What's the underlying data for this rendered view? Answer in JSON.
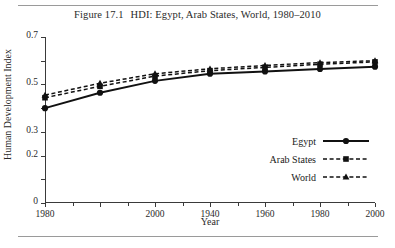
{
  "figure": {
    "caption_number": "Figure 17.1",
    "caption_text": "HDI: Egypt, Arab States, World, 1980–2010"
  },
  "chart_data": {
    "type": "line",
    "title": "HDI: Egypt, Arab States, World, 1980–2010",
    "xlabel": "Year",
    "ylabel": "Human Development Index",
    "xlim": [
      1980,
      2010
    ],
    "ylim": [
      0,
      0.7
    ],
    "grid": false,
    "legend_position": "right-inside",
    "y_ticks": [
      0,
      0.1,
      0.2,
      0.3,
      0.4,
      0.5,
      0.6,
      0.7
    ],
    "y_tick_labels": [
      "0",
      "",
      "0.2",
      "0.3",
      "",
      "0.5",
      "",
      "0.7"
    ],
    "x_ticks": [
      1980,
      1985,
      1990,
      1995,
      2000,
      2005,
      2010
    ],
    "x_tick_labels": [
      "1980",
      "",
      "2000",
      "1940",
      "1960",
      "1980",
      "2000"
    ],
    "x": [
      1980,
      1985,
      1990,
      1995,
      2000,
      2005,
      2010
    ],
    "series": [
      {
        "name": "Egypt",
        "marker": "circle",
        "line_style": "solid",
        "color": "#111111",
        "values": [
          0.4,
          0.465,
          0.515,
          0.545,
          0.555,
          0.565,
          0.575
        ]
      },
      {
        "name": "Arab States",
        "marker": "square",
        "line_style": "dashed",
        "color": "#111111",
        "values": [
          0.444,
          0.492,
          0.535,
          0.558,
          0.572,
          0.585,
          0.595
        ]
      },
      {
        "name": "World",
        "marker": "triangle",
        "line_style": "dashed",
        "color": "#111111",
        "values": [
          0.455,
          0.505,
          0.545,
          0.566,
          0.58,
          0.592,
          0.6
        ]
      }
    ]
  },
  "legend": {
    "items": [
      {
        "label": "Egypt"
      },
      {
        "label": "Arab States"
      },
      {
        "label": "World"
      }
    ]
  }
}
